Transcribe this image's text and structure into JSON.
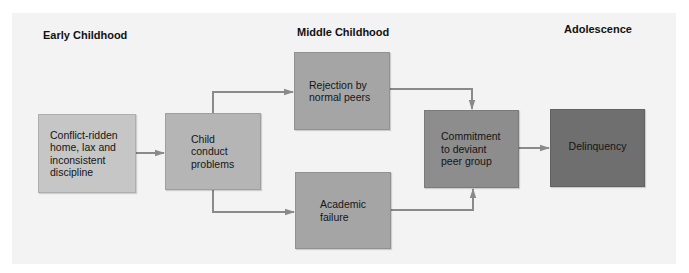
{
  "stages": [
    {
      "id": "early",
      "label": "Early Childhood"
    },
    {
      "id": "middle",
      "label": "Middle Childhood"
    },
    {
      "id": "adolescence",
      "label": "Adolescence"
    }
  ],
  "nodes": [
    {
      "id": "conflict-home",
      "label": "Conflict-ridden home, lax and inconsistent discipline",
      "stage": "Early Childhood",
      "color": "#c6c6c6"
    },
    {
      "id": "child-conduct",
      "label": "Child conduct problems",
      "stage": "Early Childhood",
      "color": "#b5b5b5"
    },
    {
      "id": "rejection-peers",
      "label": "Rejection by normal peers",
      "stage": "Middle Childhood",
      "color": "#a5a5a5"
    },
    {
      "id": "academic-failure",
      "label": "Academic failure",
      "stage": "Middle Childhood",
      "color": "#a5a5a5"
    },
    {
      "id": "deviant-peers",
      "label": "Commitment to deviant peer group",
      "stage": "Middle Childhood",
      "color": "#8d8d8d"
    },
    {
      "id": "delinquency",
      "label": "Delinquency",
      "stage": "Adolescence",
      "color": "#6f6f6f"
    }
  ],
  "edges": [
    {
      "from": "conflict-home",
      "to": "child-conduct"
    },
    {
      "from": "child-conduct",
      "to": "rejection-peers"
    },
    {
      "from": "child-conduct",
      "to": "academic-failure"
    },
    {
      "from": "rejection-peers",
      "to": "deviant-peers"
    },
    {
      "from": "academic-failure",
      "to": "deviant-peers"
    },
    {
      "from": "deviant-peers",
      "to": "delinquency"
    }
  ],
  "colors": {
    "panel": "#f3f3f3",
    "arrow": "#8a8a8a"
  }
}
